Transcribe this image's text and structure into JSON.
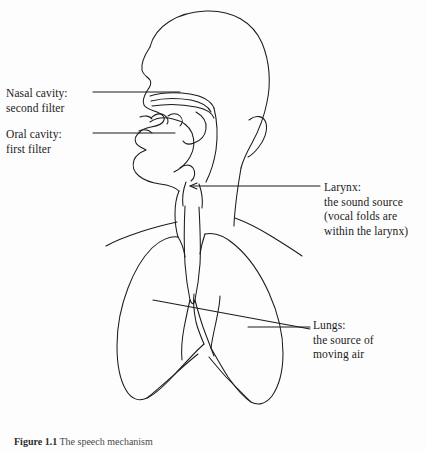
{
  "figure": {
    "caption_number": "Figure 1.1",
    "caption_text": "The speech mechanism",
    "ink_color": "#1b1b1b",
    "background_color": "#fdfdfd"
  },
  "labels": {
    "nasal": {
      "line1": "Nasal cavity:",
      "line2": "second filter"
    },
    "oral": {
      "line1": "Oral cavity:",
      "line2": "first filter"
    },
    "larynx": {
      "line1": "Larynx:",
      "line2": "the sound source",
      "line3": "(vocal folds are",
      "line4": "within the larynx)"
    },
    "lungs": {
      "line1": "Lungs:",
      "line2": "the source of",
      "line3": "moving air"
    }
  },
  "anatomy_parts": [
    "head-outline",
    "nasal-cavity",
    "soft-palate",
    "tongue",
    "lips",
    "jaw",
    "ear",
    "neck",
    "shoulders",
    "trachea",
    "larynx",
    "left-lung",
    "right-lung",
    "bronchi",
    "diaphragm"
  ]
}
